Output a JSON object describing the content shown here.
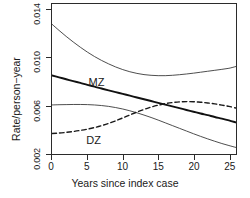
{
  "chart_data": {
    "type": "line",
    "title": "",
    "subtitle": "",
    "xlabel": "Years since index case",
    "ylabel": "Rate/person−year",
    "xlim": [
      0,
      26
    ],
    "ylim": [
      0.0019,
      0.0145
    ],
    "grid": false,
    "legend_position": "inline-annotation",
    "xticks": [
      0,
      5,
      10,
      15,
      20,
      25
    ],
    "xtick_labels": [
      "0",
      "5",
      "10",
      "15",
      "20",
      "25"
    ],
    "yticks": [
      0.002,
      0.006,
      0.01,
      0.014
    ],
    "ytick_labels": [
      "0.002",
      "0.006",
      "0.010",
      "0.014"
    ],
    "annotations": [
      {
        "text": "MZ",
        "x": 6.5,
        "y": 0.0079
      },
      {
        "text": "DZ",
        "x": 6.2,
        "y": 0.0031
      }
    ],
    "x": [
      0,
      1,
      2,
      3,
      4,
      5,
      6,
      7,
      8,
      9,
      10,
      11,
      12,
      13,
      14,
      15,
      16,
      17,
      18,
      19,
      20,
      21,
      22,
      23,
      24,
      25,
      26
    ],
    "series": [
      {
        "name": "MZ upper confidence limit",
        "style": "solid-thin",
        "color": "#3a3a3a",
        "values": [
          0.0128,
          0.01228,
          0.01178,
          0.01131,
          0.01087,
          0.01046,
          0.01009,
          0.00976,
          0.00947,
          0.00921,
          0.00899,
          0.00881,
          0.00867,
          0.00857,
          0.00851,
          0.00848,
          0.00848,
          0.00851,
          0.00856,
          0.00862,
          0.00869,
          0.00877,
          0.00885,
          0.00893,
          0.00901,
          0.0091,
          0.00925
        ]
      },
      {
        "name": "MZ",
        "style": "solid-thick",
        "color": "#111111",
        "values": [
          0.0085,
          0.00834,
          0.00818,
          0.00802,
          0.00787,
          0.00771,
          0.00756,
          0.0074,
          0.00725,
          0.0071,
          0.00695,
          0.0068,
          0.00665,
          0.0065,
          0.00635,
          0.0062,
          0.00605,
          0.0059,
          0.00575,
          0.0056,
          0.00545,
          0.0053,
          0.00516,
          0.00501,
          0.00487,
          0.00472,
          0.00455
        ]
      },
      {
        "name": "MZ lower confidence limit",
        "style": "solid-thin",
        "color": "#3a3a3a",
        "values": [
          0.00602,
          0.00604,
          0.00605,
          0.00606,
          0.00606,
          0.00605,
          0.00602,
          0.00597,
          0.0059,
          0.0058,
          0.00568,
          0.00553,
          0.00536,
          0.00517,
          0.00497,
          0.00475,
          0.00452,
          0.00429,
          0.00406,
          0.00383,
          0.0036,
          0.00338,
          0.00317,
          0.00297,
          0.00278,
          0.00261,
          0.00245
        ]
      },
      {
        "name": "DZ",
        "style": "dashed",
        "color": "#1a1a1a",
        "values": [
          0.00362,
          0.00366,
          0.00372,
          0.00379,
          0.00388,
          0.00399,
          0.00412,
          0.00428,
          0.00447,
          0.00469,
          0.00493,
          0.00518,
          0.00542,
          0.00564,
          0.00584,
          0.006,
          0.00613,
          0.00622,
          0.00628,
          0.0063,
          0.00629,
          0.00625,
          0.00619,
          0.00611,
          0.00601,
          0.0059,
          0.00576
        ]
      }
    ]
  },
  "axes": {
    "x_title": "Years since index case",
    "y_title": "Rate/person−year"
  },
  "labels": {
    "mz": "MZ",
    "dz": "DZ"
  }
}
